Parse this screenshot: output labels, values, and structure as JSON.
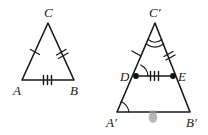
{
  "figure": {
    "background_color": "#ffffff",
    "stroke_color": "#1a1a1a",
    "smudge_color": "#9c9c9c",
    "width": 208,
    "height": 135
  },
  "left_triangle": {
    "name": "triangle-ABC",
    "vertices": [
      {
        "label": "C",
        "x": 48,
        "y": 23,
        "label_x": 44,
        "label_y": 17
      },
      {
        "label": "A",
        "x": 22,
        "y": 80,
        "label_x": 13,
        "label_y": 95
      },
      {
        "label": "B",
        "x": 74,
        "y": 80,
        "label_x": 70,
        "label_y": 95
      }
    ],
    "sides": [
      {
        "name": "side-AC",
        "ticks": 1
      },
      {
        "name": "side-BC",
        "ticks": 2
      },
      {
        "name": "side-AB",
        "ticks": 3
      }
    ]
  },
  "right_triangle": {
    "name": "triangle-A-prime-B-prime-C-prime",
    "vertices": [
      {
        "label": "C′",
        "x": 155,
        "y": 23,
        "label_x": 149,
        "label_y": 17
      },
      {
        "label": "A′",
        "x": 117,
        "y": 112,
        "label_x": 106,
        "label_y": 127
      },
      {
        "label": "B′",
        "x": 190,
        "y": 112,
        "label_x": 186,
        "label_y": 127
      }
    ],
    "midsegment_points": [
      {
        "label": "D",
        "x": 136,
        "y": 76,
        "label_x": 120,
        "label_y": 81
      },
      {
        "label": "E",
        "x": 173,
        "y": 76,
        "label_x": 178,
        "label_y": 81
      }
    ],
    "sides": [
      {
        "name": "segment-C-prime-D",
        "ticks": 1
      },
      {
        "name": "segment-C-prime-E",
        "ticks": 2
      },
      {
        "name": "segment-DE",
        "ticks": 3
      }
    ],
    "angle_marks": [
      {
        "name": "angle-C-prime",
        "arcs": 2
      },
      {
        "name": "angle-D",
        "arcs": 1
      },
      {
        "name": "angle-A-prime",
        "arcs": 1
      }
    ]
  }
}
